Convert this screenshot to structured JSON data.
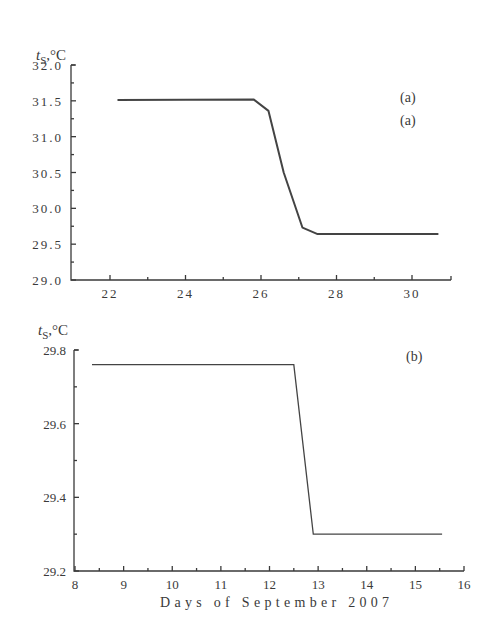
{
  "figure": {
    "xlabel": "Days of September 2007"
  },
  "chart_data": [
    {
      "type": "line",
      "panel": "(a)",
      "panel_labels": [
        "(a)",
        "(a)"
      ],
      "ylabel": "t_S, °C",
      "ylabel_main": "t",
      "ylabel_sub": "S",
      "ylabel_unit": ",°C",
      "xlabel": "",
      "xlim": [
        21.0,
        31.0
      ],
      "ylim": [
        29.0,
        32.0
      ],
      "xticks": [
        22,
        24,
        26,
        28,
        30
      ],
      "xtick_labels": [
        "22",
        "24",
        "26",
        "28",
        "30"
      ],
      "yticks": [
        29.0,
        29.5,
        30.0,
        30.5,
        31.0,
        31.5,
        32.0
      ],
      "ytick_labels": [
        "29.0",
        "29.5",
        "30.0",
        "30.5",
        "31.0",
        "31.5",
        "32.0"
      ],
      "grid": false,
      "series": [
        {
          "name": "t_S",
          "x": [
            22.2,
            25.8,
            26.2,
            26.6,
            27.1,
            27.5,
            30.7
          ],
          "y": [
            31.51,
            31.52,
            31.36,
            30.5,
            29.73,
            29.64,
            29.64
          ]
        }
      ]
    },
    {
      "type": "line",
      "panel": "(b)",
      "ylabel": "t_S, °C",
      "ylabel_main": "t",
      "ylabel_sub": "S",
      "ylabel_unit": ",°C",
      "xlabel": "Days of September 2007",
      "xlim": [
        8,
        16
      ],
      "ylim": [
        29.2,
        29.8
      ],
      "xticks": [
        8,
        9,
        10,
        11,
        12,
        13,
        14,
        15,
        16
      ],
      "xtick_labels": [
        "8",
        "9",
        "10",
        "11",
        "12",
        "13",
        "14",
        "15",
        "16"
      ],
      "yticks": [
        29.2,
        29.4,
        29.6,
        29.8
      ],
      "ytick_labels": [
        "29.2",
        "29.4",
        "29.6",
        "29.8"
      ],
      "grid": false,
      "series": [
        {
          "name": "t_S",
          "x": [
            8.35,
            12.5,
            12.9,
            15.55
          ],
          "y": [
            29.76,
            29.76,
            29.3,
            29.3
          ]
        }
      ]
    }
  ]
}
